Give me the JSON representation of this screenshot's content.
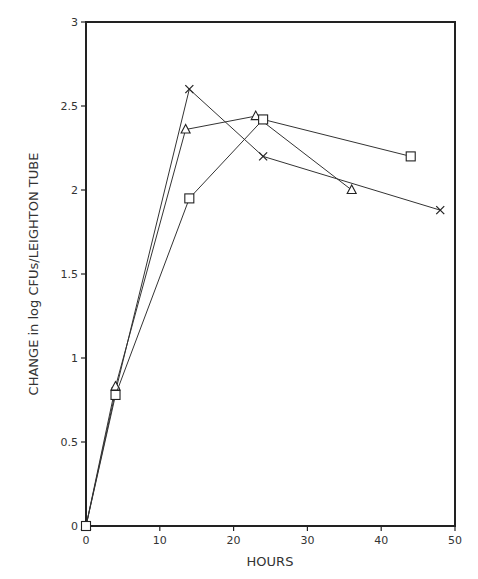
{
  "chart_data": {
    "type": "line",
    "title": "",
    "xlabel": "HOURS",
    "ylabel": "CHANGE in log CFUs/LEIGHTON TUBE",
    "xlim": [
      0,
      50
    ],
    "ylim": [
      0,
      3
    ],
    "x_ticks": [
      0,
      10,
      20,
      30,
      40,
      50
    ],
    "y_ticks": [
      0,
      0.5,
      1,
      1.5,
      2,
      2.5,
      3
    ],
    "x_tick_labels": [
      "0",
      "10",
      "20",
      "30",
      "40",
      "50"
    ],
    "y_tick_labels": [
      "0",
      "0.5",
      "1",
      "1.5",
      "2",
      "2.5",
      "3"
    ],
    "grid": false,
    "legend": null,
    "series": [
      {
        "name": "cross",
        "marker": "x",
        "x": [
          0,
          4,
          14,
          24,
          48
        ],
        "y": [
          0,
          0.8,
          2.6,
          2.2,
          1.88
        ]
      },
      {
        "name": "triangle",
        "marker": "triangle",
        "x": [
          0,
          4,
          13.5,
          23,
          36
        ],
        "y": [
          0,
          0.83,
          2.36,
          2.44,
          2.0
        ]
      },
      {
        "name": "square",
        "marker": "square",
        "x": [
          0,
          4,
          14,
          24,
          44
        ],
        "y": [
          0,
          0.78,
          1.95,
          2.42,
          2.2
        ]
      }
    ]
  }
}
